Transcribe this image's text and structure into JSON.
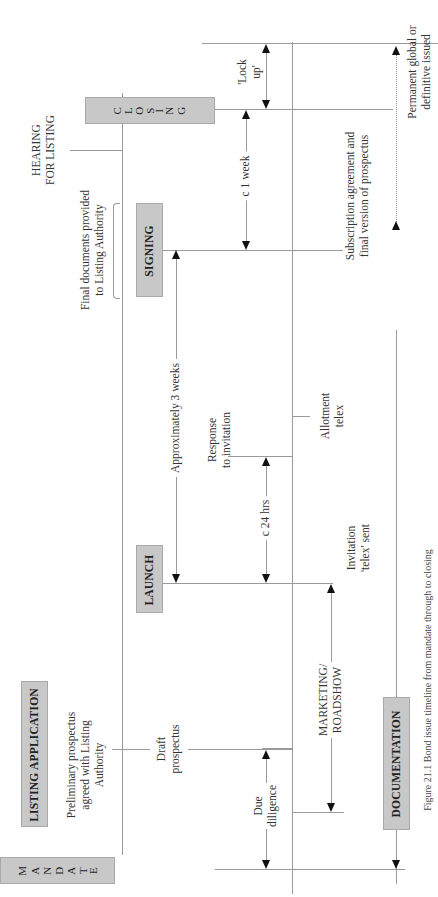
{
  "figure": {
    "orientation": "rotated -90deg (timeline runs bottom to top)",
    "caption": "Figure 21.1  Bond issue timeline from mandate through to closing"
  },
  "milestones": {
    "mandate": {
      "label": "MANDATE",
      "letters": [
        "M",
        "A",
        "N",
        "D",
        "A",
        "T",
        "E"
      ]
    },
    "launch": {
      "label": "LAUNCH"
    },
    "signing": {
      "label": "SIGNING"
    },
    "closing": {
      "label": "CLOSING",
      "letters": [
        "C",
        "L",
        "O",
        "S",
        "I",
        "N",
        "G"
      ]
    },
    "listing_application": {
      "label": "LISTING APPLICATION"
    },
    "documentation": {
      "label": "DOCUMENTATION"
    }
  },
  "annotations": {
    "preliminary_prospectus": [
      "Preliminary prospectus",
      "agreed with Listing",
      "Authority"
    ],
    "draft_prospectus": [
      "Draft",
      "prospectus"
    ],
    "final_documents": [
      "Final documents provided",
      "to Listing Authority"
    ],
    "hearing_for_listing": [
      "HEARING",
      "FOR LISTING"
    ],
    "due_diligence": [
      "Due",
      "diligence"
    ],
    "marketing_roadshow": [
      "MARKETING/",
      "ROADSHOW"
    ],
    "invitation_telex": [
      "Invitation",
      "'telex' sent"
    ],
    "response_to_invitation": [
      "Response",
      "to invitation"
    ],
    "allotment_telex": [
      "Allotment",
      "telex"
    ],
    "subscription_agreement": [
      "Subscription agreement and",
      "final version of prospectus"
    ],
    "permanent_global": [
      "Permanent global or",
      "definitive issued"
    ]
  },
  "durations": {
    "approx_3_weeks": "Approximately 3 weeks",
    "c_24_hrs": "c 24 hrs",
    "c_1_week": "c 1 week",
    "lock_up": [
      "'Lock",
      "up'"
    ]
  },
  "colors": {
    "box_fill": "#c8c8c8",
    "line": "#9a9a9a",
    "arrow": "#111111",
    "text": "#333333"
  }
}
